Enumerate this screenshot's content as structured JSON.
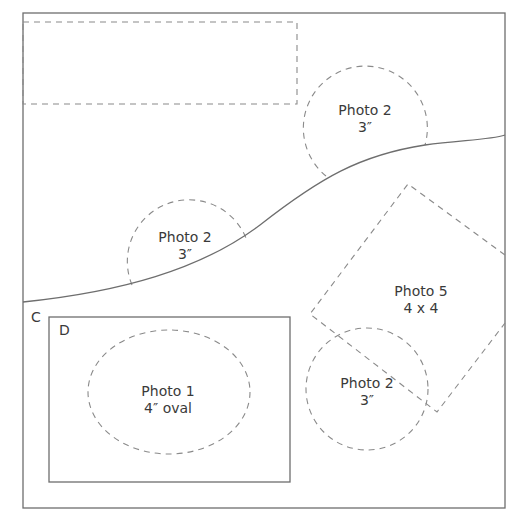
{
  "diagram": {
    "type": "scrapbook-layout-template",
    "regions": {
      "c_label": "C",
      "d_label": "D"
    },
    "photos": [
      {
        "id": "top-circle",
        "title": "Photo 2",
        "size": "3″",
        "shape": "circle"
      },
      {
        "id": "left-circle",
        "title": "Photo 2",
        "size": "3″",
        "shape": "circle"
      },
      {
        "id": "oval",
        "title": "Photo 1",
        "size": "4″ oval",
        "shape": "oval"
      },
      {
        "id": "diamond",
        "title": "Photo 5",
        "size": "4 x 4",
        "shape": "square-rotated"
      },
      {
        "id": "bottom-circle",
        "title": "Photo 2",
        "size": "3″",
        "shape": "circle"
      }
    ],
    "colors": {
      "line": "#6e6e6e",
      "dash": "#8a8a8a",
      "text": "#3a3a3a"
    }
  }
}
